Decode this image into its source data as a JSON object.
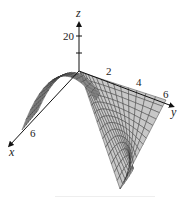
{
  "figure": {
    "type": "3d-surface-wireframe",
    "colors": {
      "surface_fill": "#c8c8c8",
      "mesh_line": "#333333",
      "axis": "#111111",
      "background": "#ffffff"
    },
    "axes": {
      "z": {
        "label": "z",
        "ticks": [
          {
            "label": "20"
          },
          {
            "label": ""
          }
        ]
      },
      "y": {
        "label": "y",
        "ticks": [
          {
            "label": "2"
          },
          {
            "label": "4"
          },
          {
            "label": "6"
          }
        ]
      },
      "x": {
        "label": "x",
        "ticks": [
          {
            "label": "6"
          }
        ]
      }
    }
  },
  "chart_data": {
    "type": "surface3d",
    "title": "",
    "xlabel": "x",
    "ylabel": "y",
    "zlabel": "z",
    "x_ticks": [
      "6"
    ],
    "y_ticks": [
      "2",
      "4",
      "6"
    ],
    "z_ticks": [
      "20"
    ],
    "xlim": [
      0,
      6
    ],
    "ylim": [
      0,
      6
    ],
    "grid": false,
    "mesh": "wireframe over shaded gray surface, ~16x16 grid",
    "shape": "surface rises to a hump along the x-axis side (peak near x≈3, y≈0), slopes down into a deep trough at the far corner (x=6, y=6)"
  }
}
